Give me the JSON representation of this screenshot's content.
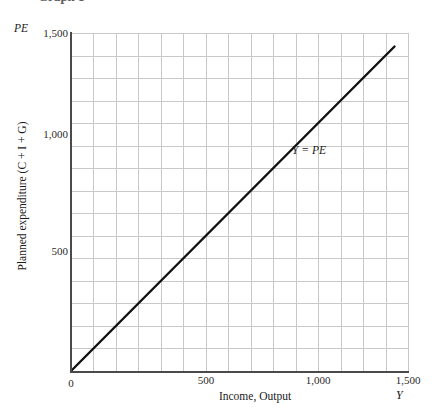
{
  "figure": {
    "title_cropped": "Graph 1",
    "background": "#ffffff"
  },
  "axes": {
    "y_symbol": "PE",
    "x_symbol": "Y",
    "y_title": "Planned expenditure (C + I + G)",
    "x_title": "Income, Output",
    "grid_color": "#c9c9c9",
    "axis_color": "#4a4a4a"
  },
  "annotations": [
    {
      "name": "identity-line-label",
      "text": "Y = PE",
      "x": 1000,
      "y": 1050
    }
  ],
  "chart_data": {
    "type": "line",
    "title": "Graph 1",
    "xlabel": "Income, Output",
    "ylabel": "Planned expenditure (C + I + G)",
    "xlim": [
      0,
      1500
    ],
    "ylim": [
      0,
      1500
    ],
    "xticks": [
      0,
      500,
      1000,
      1500
    ],
    "xtick_labels": [
      "0",
      "500",
      "1,000",
      "1,500"
    ],
    "yticks": [
      0,
      500,
      1000,
      1500
    ],
    "ytick_labels": [
      "0",
      "500",
      "1,000",
      "1,500"
    ],
    "grid": true,
    "grid_minor_step": 100,
    "legend": "none",
    "series": [
      {
        "name": "Y = PE",
        "type": "line",
        "color": "#111111",
        "linewidth": 2.2,
        "x": [
          0,
          1440
        ],
        "y": [
          0,
          1440
        ],
        "slope": 1,
        "intercept": 0,
        "annotation": "Y = PE"
      }
    ]
  }
}
